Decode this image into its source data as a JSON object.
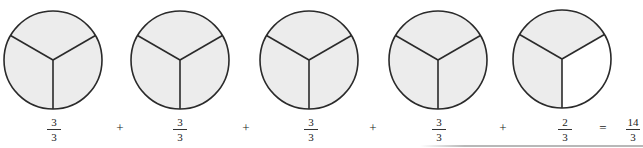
{
  "colors": {
    "shaded": "#ececec",
    "unshaded": "#ffffff",
    "stroke": "#2a2a2a"
  },
  "circles": [
    {
      "cx": 53,
      "cy": 60,
      "r": 49,
      "parts": 3,
      "shaded": 3
    },
    {
      "cx": 180,
      "cy": 60,
      "r": 49,
      "parts": 3,
      "shaded": 3
    },
    {
      "cx": 309,
      "cy": 60,
      "r": 49,
      "parts": 3,
      "shaded": 3
    },
    {
      "cx": 438,
      "cy": 60,
      "r": 49,
      "parts": 3,
      "shaded": 3
    },
    {
      "cx": 562,
      "cy": 59,
      "r": 49,
      "parts": 3,
      "shaded": 2
    }
  ],
  "equation": {
    "terms": [
      {
        "numerator": "3",
        "denominator": "3",
        "x": 54
      },
      {
        "numerator": "3",
        "denominator": "3",
        "x": 180
      },
      {
        "numerator": "3",
        "denominator": "3",
        "x": 311
      },
      {
        "numerator": "3",
        "denominator": "3",
        "x": 439
      },
      {
        "numerator": "2",
        "denominator": "3",
        "x": 565
      }
    ],
    "operators": [
      {
        "symbol": "+",
        "x": 120
      },
      {
        "symbol": "+",
        "x": 246
      },
      {
        "symbol": "+",
        "x": 373
      },
      {
        "symbol": "+",
        "x": 503
      },
      {
        "symbol": "=",
        "x": 603
      }
    ],
    "result": {
      "numerator": "14",
      "denominator": "3",
      "x": 633
    }
  }
}
